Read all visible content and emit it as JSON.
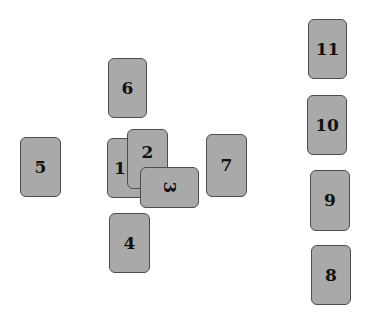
{
  "diagram": {
    "type": "tarot-spread-layout",
    "card_color": "#a9a9a9",
    "border_color": "#4d4d4d",
    "cards": [
      {
        "label": "1",
        "x": 107,
        "y": 138,
        "w": 40,
        "h": 60,
        "orientation": "upright"
      },
      {
        "label": "2",
        "x": 127,
        "y": 129,
        "w": 41,
        "h": 60,
        "orientation": "upright"
      },
      {
        "label": "3",
        "x": 140,
        "y": 167,
        "w": 59,
        "h": 41,
        "orientation": "crossed"
      },
      {
        "label": "4",
        "x": 109,
        "y": 213,
        "w": 41,
        "h": 60,
        "orientation": "upright"
      },
      {
        "label": "5",
        "x": 20,
        "y": 137,
        "w": 41,
        "h": 60,
        "orientation": "upright"
      },
      {
        "label": "6",
        "x": 108,
        "y": 58,
        "w": 39,
        "h": 60,
        "orientation": "upright"
      },
      {
        "label": "7",
        "x": 206,
        "y": 134,
        "w": 41,
        "h": 63,
        "orientation": "upright"
      },
      {
        "label": "8",
        "x": 311,
        "y": 245,
        "w": 40,
        "h": 60,
        "orientation": "upright"
      },
      {
        "label": "9",
        "x": 310,
        "y": 170,
        "w": 40,
        "h": 61,
        "orientation": "upright"
      },
      {
        "label": "10",
        "x": 307,
        "y": 95,
        "w": 40,
        "h": 60,
        "orientation": "upright"
      },
      {
        "label": "11",
        "x": 308,
        "y": 19,
        "w": 39,
        "h": 60,
        "orientation": "upright"
      }
    ]
  }
}
